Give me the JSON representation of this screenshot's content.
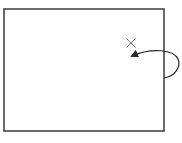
{
  "diagram": {
    "frame": {
      "x": 4,
      "y": 9,
      "width": 160,
      "height": 122,
      "stroke": "#3a3a3a",
      "stroke_width": 1.5
    },
    "x_mark": {
      "cx": 131,
      "cy": 43,
      "size": 9,
      "stroke": "#7a7a7a",
      "stroke_width": 1
    },
    "arrow": {
      "start": [
        164,
        78
      ],
      "end": [
        131,
        56
      ],
      "bulge_x": 179,
      "stroke": "#2a2a2a",
      "stroke_width": 1.2,
      "head": "filled-triangle"
    },
    "background": "#ffffff"
  }
}
